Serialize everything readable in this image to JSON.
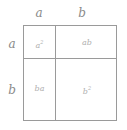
{
  "top_labels": [
    "a",
    "b"
  ],
  "side_labels": [
    "a",
    "b"
  ],
  "cells": {
    "aa": {
      "base": "a",
      "exp": "2"
    },
    "ab": {
      "text": "ab"
    },
    "ba": {
      "text": "ba"
    },
    "bb": {
      "base": "b",
      "exp": "2"
    }
  },
  "colors": {
    "line": "#9a9a9a",
    "label": "#8a8a8a",
    "cell_text": "#b0b0b0"
  }
}
